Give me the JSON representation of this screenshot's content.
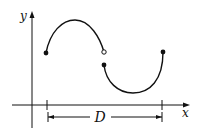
{
  "diagram": {
    "type": "piecewise-function-graph",
    "axes": {
      "x_label": "x",
      "y_label": "y"
    },
    "domain_label": "D",
    "features": {
      "left_endpoint": "filled",
      "jump_top": "open",
      "jump_bottom": "filled",
      "right_endpoint": "filled"
    },
    "colors": {
      "stroke": "#111111",
      "background": "#ffffff"
    }
  }
}
